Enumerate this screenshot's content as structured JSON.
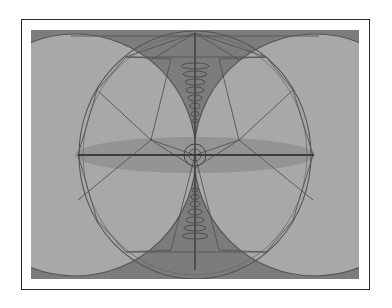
{
  "figure": {
    "colors": {
      "background": "#9a9a9a",
      "light_fill": "#b4b4b4",
      "dark_fill": "#7a7a7a",
      "stroke": "#4a4a4a",
      "frame_border": "#2a2a2a"
    },
    "shapes": {
      "left_circle": {
        "cx": 44,
        "cy": 125,
        "r": 121
      },
      "right_circle": {
        "cx": 284,
        "cy": 125,
        "r": 121
      },
      "central_circle": {
        "cx": 164,
        "cy": 125,
        "rx": 116,
        "ry": 124
      },
      "center_small_circle": {
        "cx": 164,
        "cy": 125,
        "r": 11
      },
      "horizontal_axis": {
        "x1": 47,
        "x2": 283,
        "y": 125
      },
      "vertical_axis": {
        "x": 164,
        "y1": 3,
        "y2": 240
      }
    }
  }
}
